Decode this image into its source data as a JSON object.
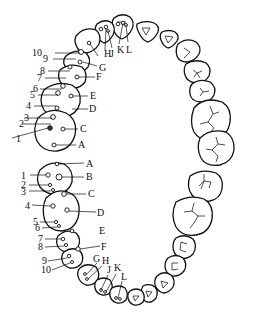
{
  "diagram": {
    "type": "dental-arch-labeled-points",
    "upper_left_quadrant": {
      "numeric_labels": [
        "10",
        "9",
        "8",
        "7",
        "6",
        "5",
        "4",
        "3",
        "2",
        "1"
      ],
      "letter_labels": [
        "H",
        "J",
        "K",
        "L",
        "G",
        "F",
        "E",
        "D",
        "C",
        "B",
        "A"
      ]
    },
    "lower_left_quadrant": {
      "numeric_labels": [
        "1",
        "2",
        "3",
        "4",
        "5",
        "6",
        "7",
        "8",
        "9",
        "10"
      ],
      "letter_labels": [
        "A",
        "B",
        "C",
        "D",
        "E",
        "F",
        "G",
        "H",
        "J",
        "K",
        "L"
      ]
    },
    "colors": {
      "line": "#111111",
      "background": "#ffffff"
    }
  },
  "labels": {
    "u10": "10",
    "u9": "9",
    "u8": "8",
    "u7": "7",
    "u6": "6",
    "u5": "5",
    "u4": "4",
    "u3": "3",
    "u2": "2",
    "u1": "1",
    "uH": "H",
    "uJ": "J",
    "uK": "K",
    "uL": "L",
    "uG": "G",
    "uF": "F",
    "uE": "E",
    "uD": "D",
    "uC": "C",
    "uB": "B",
    "uA": "A",
    "l1": "1",
    "l2": "2",
    "l3": "3",
    "l4": "4",
    "l5": "5",
    "l6": "6",
    "l7": "7",
    "l8": "8",
    "l9": "9",
    "l10": "10",
    "lA": "A",
    "lB": "B",
    "lC": "C",
    "lD": "D",
    "lE": "E",
    "lF": "F",
    "lG": "G",
    "lH": "H",
    "lJ": "J",
    "lK": "K",
    "lL": "L"
  }
}
